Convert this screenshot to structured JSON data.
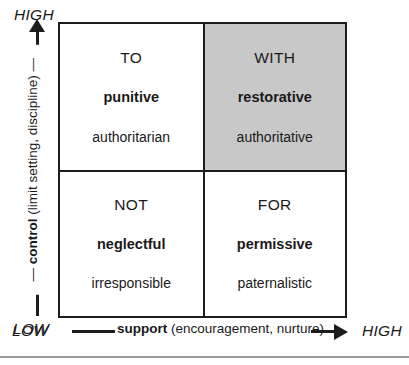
{
  "diagram": {
    "name": "Social Discipline Window",
    "shaded_quadrant": "WITH",
    "shade_color": "#c8c8c8",
    "line_color": "#1c1c1c"
  },
  "y_axis": {
    "high_label": "HIGH",
    "low_label": "LOW",
    "name_bold": "control",
    "name_detail": "(limit setting, discipline)",
    "arrow": "arrow-up"
  },
  "x_axis": {
    "low_label": "LOW",
    "high_label": "HIGH",
    "name_bold": "support",
    "name_detail": "(encouragement, nurture)",
    "arrow": "arrow-right"
  },
  "quadrants": [
    {
      "position": "top-left",
      "preposition": "TO",
      "approach": "punitive",
      "style": "authoritarian",
      "shaded": false
    },
    {
      "position": "top-right",
      "preposition": "WITH",
      "approach": "restorative",
      "style": "authoritative",
      "shaded": true
    },
    {
      "position": "bottom-left",
      "preposition": "NOT",
      "approach": "neglectful",
      "style": "irresponsible",
      "shaded": false
    },
    {
      "position": "bottom-right",
      "preposition": "FOR",
      "approach": "permissive",
      "style": "paternalistic",
      "shaded": false
    }
  ]
}
